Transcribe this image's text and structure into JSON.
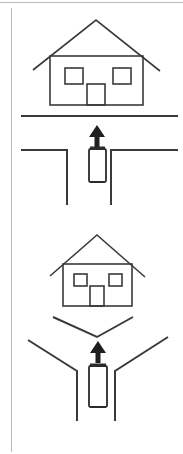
{
  "canvas": {
    "width": 183,
    "height": 454,
    "background": "#ffffff",
    "ink_color": "#3a3a3a",
    "frame_color": "#b9b9b9",
    "arrow_color": "#1f1f1f",
    "title": "Driving scenario line diagram"
  },
  "frame": {
    "top_rule_label": "top-border-rule",
    "left_rule_label": "left-border-rule",
    "top_rule": {
      "x1": 0,
      "y1": 2,
      "x2": 183,
      "y2": 2
    },
    "left_rule": {
      "x1": 11,
      "y1": 8,
      "x2": 11,
      "y2": 452
    }
  },
  "panels": [
    {
      "id": "panel-top",
      "name": "t-intersection-scenario",
      "label": "T intersection with house ahead",
      "house": {
        "name": "house-top",
        "body": {
          "x": 50,
          "y": 56,
          "width": 93,
          "height": 49
        },
        "roof": {
          "left_x": 33,
          "left_y": 70,
          "peak_x": 96,
          "peak_y": 20,
          "right_x": 160,
          "right_y": 71
        },
        "windows": [
          {
            "name": "window-left",
            "x": 65,
            "y": 68,
            "width": 18,
            "height": 16
          },
          {
            "name": "window-right",
            "x": 113,
            "y": 68,
            "width": 18,
            "height": 16
          }
        ],
        "door": {
          "name": "door",
          "x": 87,
          "y": 84,
          "width": 18,
          "height": 21
        }
      },
      "road_lines": [
        {
          "name": "far-road-edge",
          "points": "21,116 178,116"
        },
        {
          "name": "near-road-edge-left",
          "points": "21,150 67,150 67,205"
        },
        {
          "name": "near-road-edge-right",
          "points": "178,150 111,150 111,205"
        }
      ],
      "arrow": {
        "name": "direction-arrow-up",
        "cx": 97,
        "tip_y": 125,
        "tail_y": 147,
        "direction": "up"
      },
      "vehicle": {
        "name": "ego-vehicle",
        "x": 89,
        "y": 148,
        "width": 17,
        "height": 34
      }
    },
    {
      "id": "panel-bottom",
      "name": "y-intersection-scenario",
      "label": "Y intersection with house ahead",
      "house": {
        "name": "house-bottom",
        "body": {
          "x": 63,
          "y": 264,
          "width": 69,
          "height": 42
        },
        "roof": {
          "left_x": 50,
          "left_y": 276,
          "peak_x": 97,
          "peak_y": 235,
          "right_x": 145,
          "right_y": 277
        },
        "windows": [
          {
            "name": "window-left",
            "x": 74,
            "y": 274,
            "width": 13,
            "height": 12
          },
          {
            "name": "window-right",
            "x": 109,
            "y": 274,
            "width": 13,
            "height": 12
          }
        ],
        "door": {
          "name": "door",
          "x": 90,
          "y": 286,
          "width": 14,
          "height": 20
        }
      },
      "road_lines": [
        {
          "name": "far-road-chevron",
          "points": "53,317 97,337 133,317"
        },
        {
          "name": "near-road-edge-left",
          "points": "28,340 77,371 77,421"
        },
        {
          "name": "near-road-edge-right",
          "points": "168,337 115,371 115,421"
        }
      ],
      "arrow": {
        "name": "direction-arrow-up",
        "cx": 98,
        "tip_y": 341,
        "tail_y": 363,
        "direction": "up"
      },
      "vehicle": {
        "name": "ego-vehicle",
        "x": 89,
        "y": 365,
        "width": 18,
        "height": 42
      }
    }
  ]
}
